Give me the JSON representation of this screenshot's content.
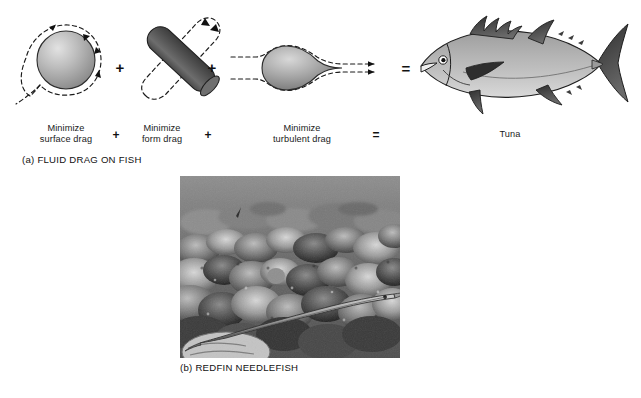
{
  "figure": {
    "panel_a": {
      "caption": "(a) FLUID DRAG ON FISH",
      "terms": [
        {
          "id": "surface-drag",
          "label": "Minimize\nsurface drag",
          "shape": "sphere"
        },
        {
          "id": "form-drag",
          "label": "Minimize\nform drag",
          "shape": "cylinder"
        },
        {
          "id": "turbulent-drag",
          "label": "Minimize\nturbulent drag",
          "shape": "teardrop"
        },
        {
          "id": "result",
          "label": "Tuna",
          "shape": "tuna"
        }
      ],
      "operators": [
        "+",
        "+",
        "="
      ],
      "colors": {
        "sphere_highlight": "#dcdcdc",
        "sphere_shadow": "#8a8a8a",
        "cylinder_body": "#575757",
        "cylinder_shade": "#3f3f3f",
        "teardrop_light": "#c9c9c9",
        "teardrop_dark": "#6b6b6b",
        "fish_body": "#b0b0b0",
        "fish_belly": "#d5d5d5",
        "fish_fin_dark": "#3a3a3a",
        "outline": "#1a1a1a",
        "flowline": "#1a1a1a"
      }
    },
    "panel_b": {
      "caption": "(b) REDFIN NEEDLEFISH",
      "photo_subject": "redfin needlefish over coral reef",
      "photo_style": "grayscale underwater photograph"
    }
  }
}
